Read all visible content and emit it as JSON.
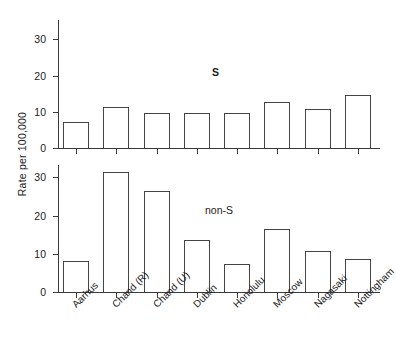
{
  "chart_data": {
    "type": "bar",
    "title": "",
    "subtitle": "",
    "xlabel": "",
    "ylabel": "Rate per 100,000",
    "categories": [
      "Aarhus",
      "Chand (R)",
      "Chand (U)",
      "Dublin",
      "Honolulu",
      "Moscow",
      "Nagasaki",
      "Nottingham"
    ],
    "panels": [
      {
        "name": "S",
        "annotation": "S",
        "ylim": [
          0,
          35
        ],
        "yticks": [
          0,
          10,
          20,
          30
        ],
        "ytick_labels": [
          "0",
          "10",
          "20",
          "30"
        ],
        "grid": false,
        "values": [
          7.2,
          11.4,
          9.6,
          9.6,
          9.6,
          12.7,
          10.7,
          14.6
        ]
      },
      {
        "name": "non-S",
        "annotation": "non-S",
        "ylim": [
          0,
          35
        ],
        "yticks": [
          0,
          10,
          20,
          30
        ],
        "ytick_labels": [
          "0",
          "10",
          "20",
          "30"
        ],
        "grid": false,
        "values": [
          8.1,
          31.5,
          26.5,
          13.6,
          7.3,
          16.6,
          10.7,
          8.6
        ]
      }
    ],
    "legend": [],
    "legend_position": "none",
    "bar_facecolor": "#ffffff",
    "bar_edgecolor": "#444444",
    "axis_color": "#3a3a3a"
  }
}
